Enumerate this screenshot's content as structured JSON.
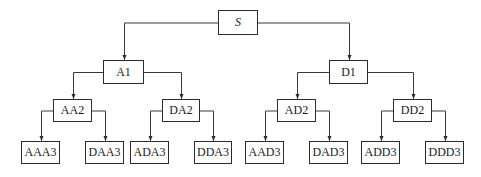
{
  "diagram": {
    "type": "tree",
    "colors": {
      "line": "#3a3a3a",
      "border": "#2b2b2b",
      "text": "#1a1a1a",
      "background": "#ffffff"
    },
    "nodes": [
      {
        "id": "S",
        "label": "S",
        "level": 0,
        "x": 218,
        "y": 10,
        "w": 40,
        "h": 25,
        "parent": null
      },
      {
        "id": "A1",
        "label": "A1",
        "level": 1,
        "x": 103,
        "y": 60,
        "w": 41,
        "h": 24,
        "parent": "S"
      },
      {
        "id": "D1",
        "label": "D1",
        "level": 1,
        "x": 329,
        "y": 60,
        "w": 39,
        "h": 24,
        "parent": "S"
      },
      {
        "id": "AA2",
        "label": "AA2",
        "level": 2,
        "x": 53,
        "y": 99,
        "w": 39,
        "h": 23,
        "parent": "A1"
      },
      {
        "id": "DA2",
        "label": "DA2",
        "level": 2,
        "x": 162,
        "y": 99,
        "w": 38,
        "h": 23,
        "parent": "A1"
      },
      {
        "id": "AD2",
        "label": "AD2",
        "level": 2,
        "x": 277,
        "y": 99,
        "w": 39,
        "h": 23,
        "parent": "D1"
      },
      {
        "id": "DD2",
        "label": "DD2",
        "level": 2,
        "x": 393,
        "y": 99,
        "w": 39,
        "h": 23,
        "parent": "D1"
      },
      {
        "id": "AAA3",
        "label": "AAA3",
        "level": 3,
        "x": 21,
        "y": 141,
        "w": 39,
        "h": 23,
        "parent": "AA2"
      },
      {
        "id": "DAA3",
        "label": "DAA3",
        "level": 3,
        "x": 85,
        "y": 141,
        "w": 39,
        "h": 23,
        "parent": "AA2"
      },
      {
        "id": "ADA3",
        "label": "ADA3",
        "level": 3,
        "x": 130,
        "y": 141,
        "w": 39,
        "h": 23,
        "parent": "DA2"
      },
      {
        "id": "DDA3",
        "label": "DDA3",
        "level": 3,
        "x": 194,
        "y": 141,
        "w": 38,
        "h": 23,
        "parent": "DA2"
      },
      {
        "id": "AAD3",
        "label": "AAD3",
        "level": 3,
        "x": 245,
        "y": 141,
        "w": 39,
        "h": 23,
        "parent": "AD2"
      },
      {
        "id": "DAD3",
        "label": "DAD3",
        "level": 3,
        "x": 309,
        "y": 141,
        "w": 39,
        "h": 23,
        "parent": "AD2"
      },
      {
        "id": "ADD3",
        "label": "ADD3",
        "level": 3,
        "x": 361,
        "y": 141,
        "w": 39,
        "h": 23,
        "parent": "DD2"
      },
      {
        "id": "DDD3",
        "label": "DDD3",
        "level": 3,
        "x": 425,
        "y": 141,
        "w": 39,
        "h": 23,
        "parent": "DD2"
      }
    ]
  }
}
